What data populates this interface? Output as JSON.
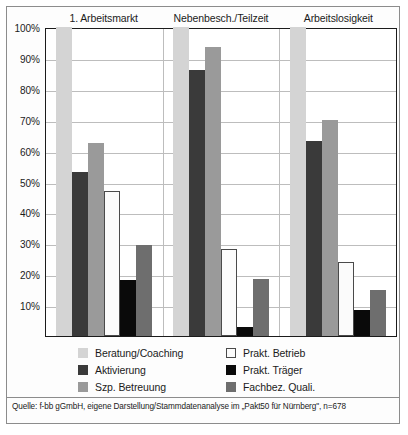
{
  "chart_data": {
    "type": "bar",
    "title": "",
    "xlabel": "",
    "ylabel": "",
    "ylim": [
      0,
      100
    ],
    "grid": true,
    "legend_position": "bottom",
    "categories": [
      "1. Arbeitsmarkt",
      "Nebenbesch./Teilzeit",
      "Arbeitslosigkeit"
    ],
    "ytick_labels": [
      "100%",
      "90%",
      "80%",
      "70%",
      "60%",
      "50%",
      "40%",
      "30%",
      "20%",
      "10%"
    ],
    "ytick_values": [
      100,
      90,
      80,
      70,
      60,
      50,
      40,
      30,
      20,
      10
    ],
    "series": [
      {
        "name": "Beratung/Coaching",
        "color": "#d4d4d4",
        "border": "#d4d4d4",
        "values": [
          100,
          100,
          100
        ]
      },
      {
        "name": "Aktivierung",
        "color": "#3a3a3a",
        "border": "#3a3a3a",
        "values": [
          53,
          86,
          63
        ]
      },
      {
        "name": "Szp. Betreuung",
        "color": "#9a9a9a",
        "border": "#9a9a9a",
        "values": [
          62.5,
          93.5,
          70
        ]
      },
      {
        "name": "Prakt. Betrieb",
        "color": "#fbfbfb",
        "border": "#4a4a4a",
        "values": [
          47,
          28,
          24
        ]
      },
      {
        "name": "Prakt. Träger",
        "color": "#0a0a0a",
        "border": "#0a0a0a",
        "values": [
          18,
          3,
          8.5
        ]
      },
      {
        "name": "Fachbez. Quali.",
        "color": "#6e6e6e",
        "border": "#6e6e6e",
        "values": [
          29.5,
          18.5,
          15
        ]
      }
    ],
    "legend_order": [
      "Beratung/Coaching",
      "Prakt. Betrieb",
      "Aktivierung",
      "Prakt. Träger",
      "Szp. Betreuung",
      "Fachbez. Quali."
    ],
    "source": "Quelle: f-bb gGmbH, eigene Darstellung/Stammdatenanalyse im „Pakt50 für Nürnberg\", n=678"
  },
  "colors": {
    "frame": "#8c8c8c",
    "axis": "#1b1b1b",
    "gridline": "#bdbdbd",
    "text": "#1b1b1b",
    "background": "#ffffff"
  }
}
